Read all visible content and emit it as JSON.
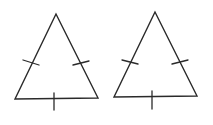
{
  "diagram": {
    "type": "geometry",
    "stroke_color": "#2a2a2a",
    "background": "#ffffff",
    "triangles": [
      {
        "id": "triangle-left",
        "vertices": [
          [
            56,
            14
          ],
          [
            15,
            99
          ],
          [
            98,
            98
          ]
        ],
        "ticks": [
          {
            "side": "left",
            "line": [
              [
                23,
                60
              ],
              [
                39,
                65
              ]
            ]
          },
          {
            "side": "right",
            "line": [
              [
                73,
                65
              ],
              [
                89,
                61
              ]
            ]
          },
          {
            "side": "base",
            "line": [
              [
                54,
                93
              ],
              [
                54,
                110
              ]
            ]
          }
        ]
      },
      {
        "id": "triangle-right",
        "vertices": [
          [
            155,
            12
          ],
          [
            114,
            97
          ],
          [
            197,
            96
          ]
        ],
        "ticks": [
          {
            "side": "left",
            "line": [
              [
                122,
                60
              ],
              [
                138,
                64
              ]
            ]
          },
          {
            "side": "right",
            "line": [
              [
                172,
                64
              ],
              [
                188,
                60
              ]
            ]
          },
          {
            "side": "base",
            "line": [
              [
                152,
                91
              ],
              [
                152,
                109
              ]
            ]
          }
        ]
      }
    ]
  }
}
